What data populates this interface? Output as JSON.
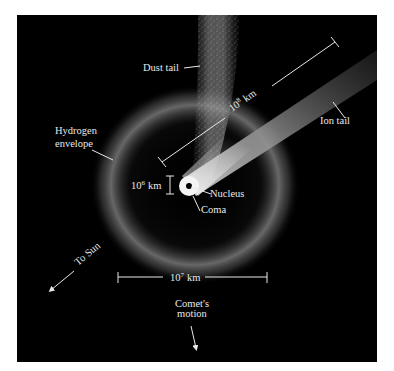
{
  "figure": {
    "background": "#000000",
    "page_background": "#ffffff",
    "label_color": "#e8e8e8",
    "labels": {
      "dust_tail": "Dust tail",
      "ion_tail": "Ion tail",
      "hydrogen_line1": "Hydrogen",
      "hydrogen_line2": "envelope",
      "nucleus": "Nucleus",
      "coma": "Coma",
      "to_sun": "To Sun",
      "comet_motion_line1": "Comet's",
      "comet_motion_line2": "motion"
    },
    "scales": {
      "tail_length": {
        "base": "10",
        "exp": "8",
        "unit": "km"
      },
      "envelope_width": {
        "base": "10",
        "exp": "7",
        "unit": "km"
      },
      "coma_size": {
        "base": "10",
        "exp": "6",
        "unit": "km"
      }
    }
  }
}
